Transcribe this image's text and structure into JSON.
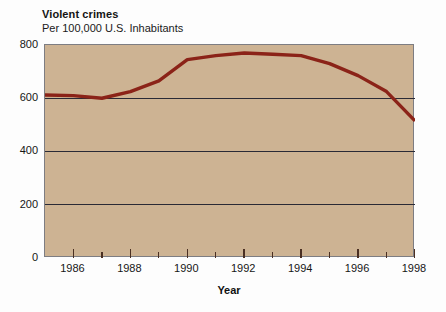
{
  "chart_data": {
    "type": "line",
    "title": "Violent crimes",
    "subtitle": "Per 100,000 U.S. Inhabitants",
    "xlabel": "Year",
    "ylabel": "",
    "xlim": [
      1985,
      1998
    ],
    "ylim": [
      0,
      800
    ],
    "grid": true,
    "gridlines_y": [
      200,
      400,
      600
    ],
    "legend": "none",
    "y_ticks": [
      0,
      200,
      400,
      600,
      800
    ],
    "y_tick_labels": [
      "0",
      "200",
      "400",
      "600",
      "800"
    ],
    "x_ticks": [
      1986,
      1987,
      1988,
      1989,
      1990,
      1991,
      1992,
      1993,
      1994,
      1995,
      1996,
      1997,
      1998
    ],
    "x_tick_labels_major": [
      "1986",
      "1988",
      "1990",
      "1992",
      "1994",
      "1996",
      "1998"
    ],
    "x_major_years": [
      1986,
      1988,
      1990,
      1992,
      1994,
      1996,
      1998
    ],
    "series": [
      {
        "name": "Violent crime rate",
        "color": "#8b2318",
        "x": [
          1985,
          1986,
          1987,
          1988,
          1989,
          1990,
          1991,
          1992,
          1993,
          1994,
          1995,
          1996,
          1997,
          1998
        ],
        "values": [
          612,
          610,
          600,
          625,
          665,
          745,
          760,
          770,
          765,
          760,
          730,
          685,
          625,
          515
        ]
      }
    ],
    "colors": {
      "line": "#8b2318",
      "plot_background": "#cdb393",
      "page_background": "#fdfdfd",
      "gridline": "#2a2a35",
      "axis_frame": "#7d7d82",
      "tick": "#4a2f22",
      "text": "#161616"
    }
  }
}
